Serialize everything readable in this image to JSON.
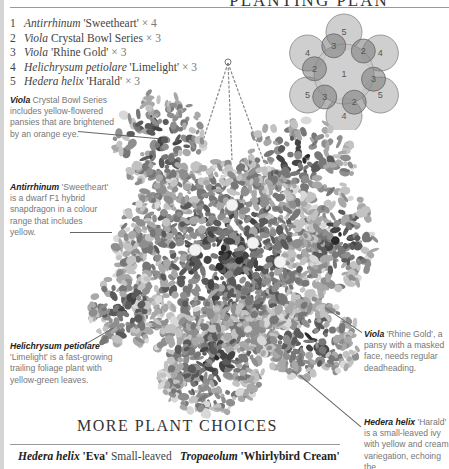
{
  "planting_plan": {
    "title": "PLANTING PLAN",
    "items": [
      {
        "number": "1",
        "genus": "Antirrhinum",
        "cultivar": "'Sweetheart'",
        "qty": "× 4"
      },
      {
        "number": "2",
        "genus": "Viola",
        "cultivar": "Crystal Bowl Series",
        "qty": "× 3"
      },
      {
        "number": "3",
        "genus": "Viola",
        "cultivar": "'Rhine Gold'",
        "qty": "× 3"
      },
      {
        "number": "4",
        "genus": "Helichrysum petiolare",
        "cultivar": "'Limelight'",
        "qty": "× 3"
      },
      {
        "number": "5",
        "genus": "Hedera helix",
        "cultivar": "'Harald'",
        "qty": "× 3"
      }
    ],
    "diagram": {
      "center_label": "1",
      "inner_labels": [
        "3",
        "2",
        "3",
        "2",
        "3",
        "2"
      ],
      "outer_labels": [
        "5",
        "4",
        "5",
        "4",
        "5",
        "4"
      ]
    }
  },
  "callouts": {
    "viola_crystal": {
      "name": "Viola",
      "text1": " Crystal Bowl Series",
      "lines": [
        "includes yellow-flowered",
        "pansies that are brightened",
        "by an orange eye."
      ]
    },
    "antirrhinum": {
      "name": "Antirrhinum",
      "text1": " 'Sweetheart'",
      "lines": [
        "is a dwarf F1 hybrid",
        "snapdragon in a colour",
        "range that includes",
        "yellow."
      ]
    },
    "helichrysum": {
      "name": "Helichrysum petiolare",
      "lines": [
        "'Limelight' is a fast-growing",
        "trailing foliage plant with",
        "yellow-green leaves."
      ]
    },
    "viola_rhine": {
      "name": "Viola",
      "text1": " 'Rhine Gold', a",
      "lines": [
        "pansy with a masked",
        "face, needs regular",
        "deadheading."
      ]
    },
    "hedera": {
      "name": "Hedera helix",
      "text1": " 'Harald'",
      "lines": [
        "is a small-leaved ivy",
        "with yellow and cream",
        "variegation, echoing the",
        "green and bright"
      ]
    }
  },
  "more_choices": {
    "title": "MORE PLANT CHOICES",
    "items": [
      {
        "genus": "Hedera helix",
        "cultivar": "'Eva'",
        "text": " Small-leaved"
      },
      {
        "genus": "Tropaeolum",
        "cultivar": "'Whirlybird Cream'",
        "text": ""
      }
    ]
  }
}
